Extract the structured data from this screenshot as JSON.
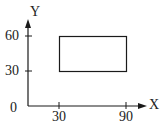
{
  "diagram": {
    "x_axis": {
      "label": "X",
      "ticks": [
        "30",
        "90"
      ]
    },
    "y_axis": {
      "label": "Y",
      "ticks": [
        "30",
        "60"
      ]
    },
    "origin_label": "0",
    "rectangle": {
      "x_from": 30,
      "x_to": 90,
      "y_from": 30,
      "y_to": 60
    },
    "colors": {
      "stroke": "#1a1a1a",
      "background": "#ffffff"
    }
  }
}
